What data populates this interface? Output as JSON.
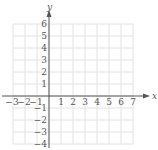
{
  "chart_data": {
    "type": "scatter",
    "title": "",
    "xlabel": "x",
    "ylabel": "y",
    "xlim": [
      -3,
      7
    ],
    "ylim": [
      -4,
      6
    ],
    "grid": true,
    "x_ticks": [
      "−3",
      "−2",
      "−1",
      "1",
      "2",
      "3",
      "4",
      "5",
      "6",
      "7"
    ],
    "y_ticks": [
      "6",
      "5",
      "4",
      "3",
      "2",
      "1",
      "−1",
      "−2",
      "−3",
      "−4"
    ],
    "series": [],
    "colors": {
      "grid": "#e2e2e2",
      "axis": "#555555"
    }
  },
  "labels": {
    "x_axis": "x",
    "y_axis": "y"
  }
}
